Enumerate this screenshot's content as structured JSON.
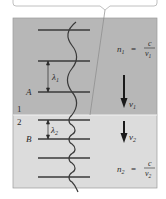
{
  "diagram": {
    "colors": {
      "medium1_fill": "#b7b7b7",
      "medium2_fill": "#d9d9d9",
      "border": "#8a8a8a",
      "line": "#3a3a3a",
      "callout_border": "#b0b0b0",
      "callout_fill": "#ffffff"
    },
    "medium1": {
      "region_label": "1",
      "point_label": "A",
      "wavelength_label": "λ",
      "wavelength_subscript": "1",
      "velocity_label": "v",
      "velocity_subscript": "1",
      "index_lhs": "n",
      "index_lhs_subscript": "1",
      "index_eq": "=",
      "index_numerator": "c",
      "index_denominator": "v",
      "index_denominator_subscript": "1"
    },
    "medium2": {
      "region_label": "2",
      "point_label": "B",
      "wavelength_label": "λ",
      "wavelength_subscript": "2",
      "velocity_label": "v",
      "velocity_subscript": "2",
      "index_lhs": "n",
      "index_lhs_subscript": "2",
      "index_eq": "=",
      "index_numerator": "c",
      "index_denominator": "v",
      "index_denominator_subscript": "2"
    }
  }
}
